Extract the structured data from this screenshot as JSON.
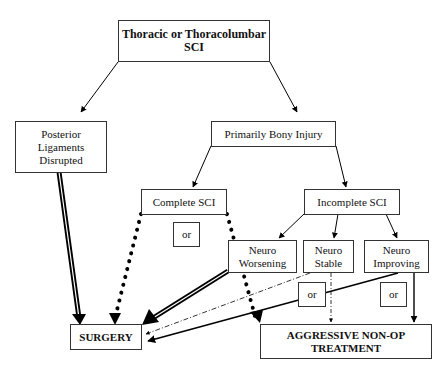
{
  "diagram": {
    "type": "flowchart",
    "nodes": {
      "root": {
        "label": "Thoracic or Thoracolumbar SCI"
      },
      "posterior": {
        "label": "Posterior Ligaments Disrupted"
      },
      "bony": {
        "label": "Primarily Bony Injury"
      },
      "complete": {
        "label": "Complete SCI"
      },
      "incomplete": {
        "label": "Incomplete SCI"
      },
      "worsening": {
        "label": "Neuro Worsening"
      },
      "stable": {
        "label": "Neuro Stable"
      },
      "improving": {
        "label": "Neuro Improving"
      },
      "surgery": {
        "label": "SURGERY"
      },
      "nonop": {
        "label": "AGGRESSIVE NON-OP TREATMENT"
      },
      "or_complete": {
        "label": "or"
      },
      "or_stable": {
        "label": "or"
      },
      "or_improving": {
        "label": "or"
      }
    },
    "edges": [
      {
        "from": "root",
        "to": "posterior",
        "style": "solid"
      },
      {
        "from": "root",
        "to": "bony",
        "style": "solid"
      },
      {
        "from": "bony",
        "to": "complete",
        "style": "solid"
      },
      {
        "from": "bony",
        "to": "incomplete",
        "style": "solid"
      },
      {
        "from": "incomplete",
        "to": "worsening",
        "style": "solid"
      },
      {
        "from": "incomplete",
        "to": "stable",
        "style": "solid"
      },
      {
        "from": "incomplete",
        "to": "improving",
        "style": "solid"
      },
      {
        "from": "posterior",
        "to": "surgery",
        "style": "triple-line"
      },
      {
        "from": "complete",
        "to": "surgery",
        "style": "dotted-heavy"
      },
      {
        "from": "complete",
        "to": "nonop",
        "style": "dotted-heavy"
      },
      {
        "from": "worsening",
        "to": "surgery",
        "style": "triple-line"
      },
      {
        "from": "stable",
        "to": "surgery",
        "style": "dash-dot"
      },
      {
        "from": "stable",
        "to": "nonop",
        "style": "dash-dot"
      },
      {
        "from": "improving",
        "to": "surgery",
        "style": "solid-thick"
      },
      {
        "from": "improving",
        "to": "nonop",
        "style": "solid-thick"
      }
    ]
  }
}
